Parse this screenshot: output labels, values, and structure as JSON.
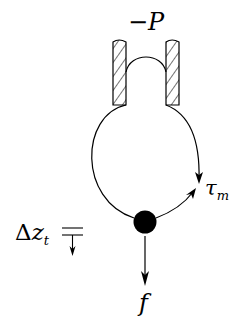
{
  "diagram": {
    "labels": {
      "pressure": "−P",
      "torque_symbol": "τ",
      "torque_sub": "m",
      "force": "f",
      "delta_symbol": "Δ",
      "displacement_var": "z",
      "displacement_sub": "t"
    },
    "elements": [
      "left-hatched-wall",
      "right-hatched-wall",
      "membrane-dome",
      "loop-curve",
      "ball-mass",
      "force-arrow",
      "displacement-marker"
    ],
    "colors": {
      "stroke": "#000000",
      "background": "#ffffff"
    }
  }
}
